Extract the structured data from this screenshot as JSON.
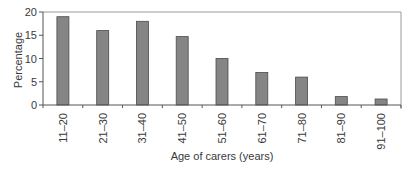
{
  "chart_data": {
    "type": "bar",
    "title": "",
    "xlabel": "Age of carers (years)",
    "ylabel": "Percentage",
    "categories": [
      "11–20",
      "21–30",
      "31–40",
      "41–50",
      "51–60",
      "61–70",
      "71–80",
      "81–90",
      "91–100"
    ],
    "values": [
      19,
      16,
      18,
      14.7,
      10,
      7,
      6,
      1.8,
      1.3
    ],
    "ylim": [
      0,
      20
    ],
    "yticks": [
      0,
      5,
      10,
      15,
      20
    ],
    "grid": false,
    "legend": null,
    "colors": {
      "bar_fill": "#858585",
      "bar_stroke": "#4a4a4a",
      "axis": "#555555",
      "frame": "#9a9a9a"
    }
  }
}
